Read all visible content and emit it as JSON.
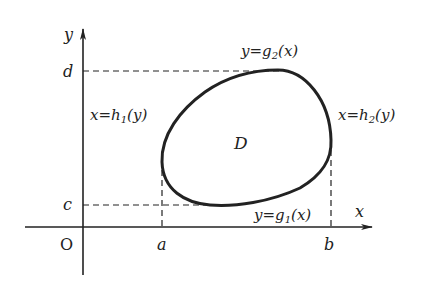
{
  "diagram": {
    "type": "region-of-integration",
    "colors": {
      "background": "#ffffff",
      "ink": "#222222"
    },
    "axes": {
      "x_label": "x",
      "y_label": "y",
      "origin_label": "O"
    },
    "ticks": {
      "a": "a",
      "b": "b",
      "c": "c",
      "d": "d"
    },
    "region": {
      "label": "D"
    },
    "boundaries": {
      "top": {
        "lhs": "y",
        "eq": "=",
        "fn": "g",
        "sub": "2",
        "arg": "(x)"
      },
      "bottom": {
        "lhs": "y",
        "eq": "=",
        "fn": "g",
        "sub": "1",
        "arg": "(x)"
      },
      "left": {
        "lhs": "x",
        "eq": "=",
        "fn": "h",
        "sub": "1",
        "arg": "(y)"
      },
      "right": {
        "lhs": "x",
        "eq": "=",
        "fn": "h",
        "sub": "2",
        "arg": "(y)"
      }
    }
  }
}
